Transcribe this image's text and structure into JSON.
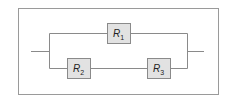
{
  "diagram": {
    "type": "circuit",
    "resistors": [
      {
        "id": "R1",
        "letter": "R",
        "subscript": "1",
        "branch": "top"
      },
      {
        "id": "R2",
        "letter": "R",
        "subscript": "2",
        "branch": "bottom"
      },
      {
        "id": "R3",
        "letter": "R",
        "subscript": "3",
        "branch": "bottom"
      }
    ],
    "colors": {
      "wire": "#8a8a8a",
      "resistor_fill": "#e2e2e2",
      "frame": "#9a9a9a",
      "text": "#222222"
    }
  }
}
